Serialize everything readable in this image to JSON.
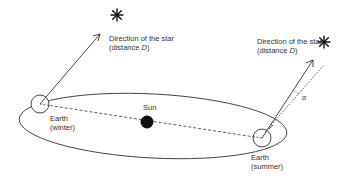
{
  "diagram": {
    "type": "stellar-parallax",
    "labels": {
      "star_left_line1": "Direction of the star",
      "star_left_line2_prefix": "(distance ",
      "star_left_line2_var": "D",
      "star_left_line2_suffix": ")",
      "star_right_line1": "Direction of the star",
      "star_right_line2_prefix": "(distance ",
      "star_right_line2_var": "D",
      "star_right_line2_suffix": ")",
      "sun": "Sun",
      "earth_winter_line1": "Earth",
      "earth_winter_line2": "(winter)",
      "earth_summer_line1": "Earth",
      "earth_summer_line2": "(summer)",
      "angle": "α"
    },
    "colors": {
      "stroke": "#333333",
      "sun_fill": "#111111",
      "background": "#ffffff"
    },
    "icons": {
      "star_left": "asterisk-star-icon",
      "star_right": "asterisk-star-icon"
    }
  }
}
